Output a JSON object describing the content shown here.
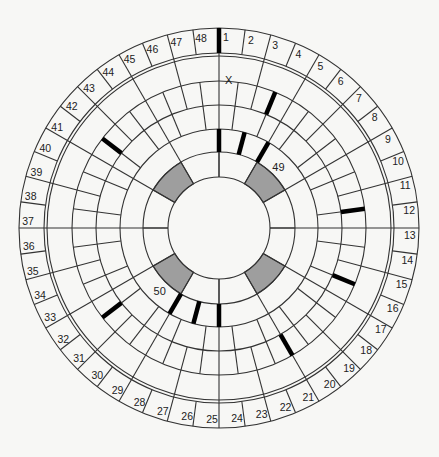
{
  "diagram": {
    "sector_count": 48,
    "sector_labels": [
      "1",
      "2",
      "3",
      "4",
      "5",
      "6",
      "7",
      "8",
      "9",
      "10",
      "11",
      "12",
      "13",
      "14",
      "15",
      "16",
      "17",
      "18",
      "19",
      "20",
      "21",
      "22",
      "23",
      "24",
      "25",
      "26",
      "27",
      "28",
      "29",
      "30",
      "31",
      "32",
      "33",
      "34",
      "35",
      "36",
      "37",
      "38",
      "39",
      "40",
      "41",
      "42",
      "43",
      "44",
      "45",
      "46",
      "47",
      "48"
    ],
    "special_labels": [
      {
        "text": "X",
        "sector_angle_deg": 3.75,
        "ring": 5
      },
      {
        "text": "49",
        "sector_angle_deg": 40,
        "ring": 4
      },
      {
        "text": "50",
        "sector_angle_deg": 218,
        "ring": 4
      }
    ],
    "rings": [
      "outer-label-band",
      "double-border",
      "ring-5",
      "ring-4",
      "ring-3",
      "ring-2",
      "ring-1",
      "center"
    ],
    "shaded_cells": [
      {
        "ring": 1,
        "center_angle_deg": 45
      },
      {
        "ring": 1,
        "center_angle_deg": 135
      },
      {
        "ring": 1,
        "center_angle_deg": 225
      },
      {
        "ring": 1,
        "center_angle_deg": 315
      }
    ],
    "markers": [
      {
        "angle_deg": 0,
        "ring": "outer-label-band"
      },
      {
        "angle_deg": 22.5,
        "ring": "ring-4"
      },
      {
        "angle_deg": 0,
        "ring": "ring-2"
      },
      {
        "angle_deg": 15,
        "ring": "ring-2"
      },
      {
        "angle_deg": 30,
        "ring": "ring-2"
      },
      {
        "angle_deg": 307.5,
        "ring": "ring-4"
      },
      {
        "angle_deg": 82.5,
        "ring": "ring-4"
      },
      {
        "angle_deg": 112.5,
        "ring": "ring-4"
      },
      {
        "angle_deg": 150,
        "ring": "ring-4"
      },
      {
        "angle_deg": 180,
        "ring": "ring-2"
      },
      {
        "angle_deg": 195,
        "ring": "ring-2"
      },
      {
        "angle_deg": 210,
        "ring": "ring-2"
      },
      {
        "angle_deg": 232.5,
        "ring": "ring-4"
      }
    ],
    "colors": {
      "line": "#333333",
      "shade": "#9e9e9e",
      "marker": "#000000",
      "background": "#f7f7f5"
    }
  }
}
